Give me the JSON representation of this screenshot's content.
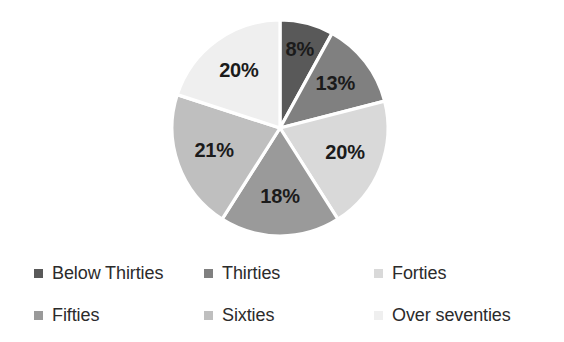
{
  "chart_data": {
    "type": "pie",
    "title": "",
    "subtitle": "",
    "xlabel": "",
    "ylabel": "",
    "grid": false,
    "legend_position": "bottom",
    "start_angle_deg": 0,
    "direction": "clockwise",
    "units": "percent",
    "categories": [
      "Below Thirties",
      "Thirties",
      "Forties",
      "Fifties",
      "Sixties",
      "Over seventies"
    ],
    "values": [
      8,
      13,
      20,
      18,
      21,
      20
    ],
    "data_labels": [
      "8%",
      "13%",
      "20%",
      "18%",
      "21%",
      "20%"
    ],
    "colors": [
      "#595959",
      "#808080",
      "#d9d9d9",
      "#9a9a9a",
      "#bfbfbf",
      "#efefef"
    ],
    "slices": [
      {
        "label": "Below Thirties",
        "value": 8,
        "display": "8%",
        "color": "#595959"
      },
      {
        "label": "Thirties",
        "value": 13,
        "display": "13%",
        "color": "#808080"
      },
      {
        "label": "Forties",
        "value": 20,
        "display": "20%",
        "color": "#d9d9d9"
      },
      {
        "label": "Fifties",
        "value": 18,
        "display": "18%",
        "color": "#9a9a9a"
      },
      {
        "label": "Sixties",
        "value": 21,
        "display": "21%",
        "color": "#bfbfbf"
      },
      {
        "label": "Over seventies",
        "value": 20,
        "display": "20%",
        "color": "#efefef"
      }
    ]
  },
  "legend": {
    "items": [
      {
        "label": "Below Thirties",
        "color": "#595959"
      },
      {
        "label": "Thirties",
        "color": "#808080"
      },
      {
        "label": "Forties",
        "color": "#d9d9d9"
      },
      {
        "label": "Fifties",
        "color": "#9a9a9a"
      },
      {
        "label": "Sixties",
        "color": "#bfbfbf"
      },
      {
        "label": "Over seventies",
        "color": "#efefef"
      }
    ]
  },
  "style": {
    "background": "#ffffff",
    "slice_border": "#ffffff",
    "label_text": "#1b1b1b",
    "legend_text": "#2b2b2b"
  }
}
